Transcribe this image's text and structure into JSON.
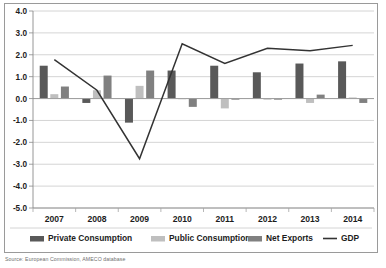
{
  "chart_data": {
    "type": "bar",
    "title": "",
    "subtitle": "",
    "xlabel": "",
    "ylabel": "",
    "categories": [
      "2007",
      "2008",
      "2009",
      "2010",
      "2011",
      "2012",
      "2013",
      "2014"
    ],
    "ylim": [
      -5.0,
      4.0
    ],
    "ytick_labels": [
      "4.0",
      "3.0",
      "2.0",
      "1.0",
      "0.0",
      "-1.0",
      "-2.0",
      "-3.0",
      "-4.0",
      "-5.0"
    ],
    "ytick_values": [
      4.0,
      3.0,
      2.0,
      1.0,
      0.0,
      -1.0,
      -2.0,
      -3.0,
      -4.0,
      -5.0
    ],
    "grid": "horizontal",
    "legend_position": "bottom",
    "series": [
      {
        "name": "Private Consumption",
        "kind": "bar",
        "color": "#595959",
        "values": [
          1.5,
          -0.2,
          -1.1,
          1.28,
          1.5,
          1.2,
          1.6,
          1.7
        ]
      },
      {
        "name": "Public Consumption",
        "kind": "bar",
        "color": "#bfbfbf",
        "values": [
          0.2,
          0.38,
          0.58,
          0.02,
          -0.45,
          -0.05,
          -0.2,
          0.05
        ]
      },
      {
        "name": "Net Exports",
        "kind": "bar",
        "color": "#808080",
        "values": [
          0.55,
          1.05,
          1.28,
          -0.38,
          -0.03,
          -0.05,
          0.18,
          -0.2
        ]
      },
      {
        "name": "GDP",
        "kind": "line",
        "color": "#333333",
        "values": [
          1.78,
          0.38,
          -2.75,
          2.5,
          1.6,
          2.3,
          2.18,
          2.43
        ]
      }
    ]
  },
  "legend": {
    "items": [
      {
        "label": "Private Consumption",
        "marker": "bar",
        "color": "#595959"
      },
      {
        "label": "Public Consumption",
        "marker": "bar",
        "color": "#bfbfbf"
      },
      {
        "label": "Net Exports",
        "marker": "bar",
        "color": "#808080"
      },
      {
        "label": "GDP",
        "marker": "line",
        "color": "#333333"
      }
    ]
  },
  "footer": {
    "source": "Source: European Commission, AMECO database"
  }
}
